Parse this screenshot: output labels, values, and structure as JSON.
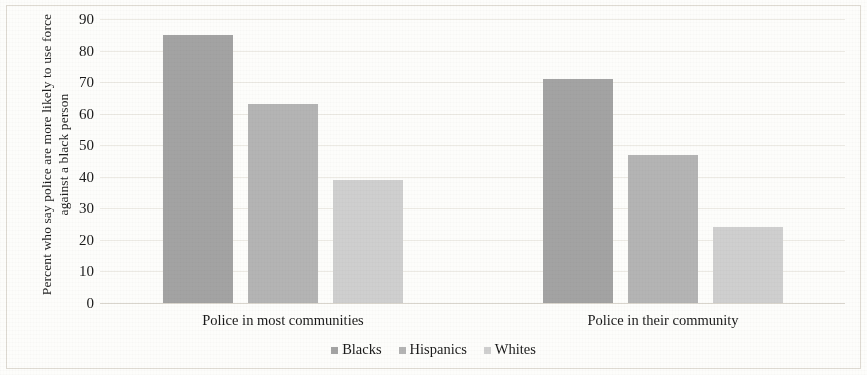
{
  "chart_data": {
    "type": "bar",
    "title": "",
    "subtitle": "",
    "xlabel": "",
    "ylabel": "Percent who say police are more likely to use force against a black person",
    "categories": [
      "Police in most communities",
      "Police in their community"
    ],
    "series": [
      {
        "name": "Blacks",
        "values": [
          85,
          71
        ],
        "color": "#a3a3a3"
      },
      {
        "name": "Hispanics",
        "values": [
          63,
          47
        ],
        "color": "#b4b4b4"
      },
      {
        "name": "Whites",
        "values": [
          39,
          24
        ],
        "color": "#cfcfcf"
      }
    ],
    "ylim": [
      0,
      90
    ],
    "ytick_labels": [
      "90",
      "80",
      "70",
      "60",
      "50",
      "40",
      "30",
      "20",
      "10",
      "0"
    ],
    "ytick_values": [
      90,
      80,
      70,
      60,
      50,
      40,
      30,
      20,
      10,
      0
    ],
    "grid": true,
    "grid_axis": "y",
    "legend_position": "bottom",
    "legend_entries": [
      "Blacks",
      "Hispanics",
      "Whites"
    ],
    "bar_group_gap": true,
    "axis_line_color": "#d9d5cd",
    "grid_color": "#eceae4",
    "text_color": "#1a1a1a",
    "background_color": "#fdfdfb"
  }
}
